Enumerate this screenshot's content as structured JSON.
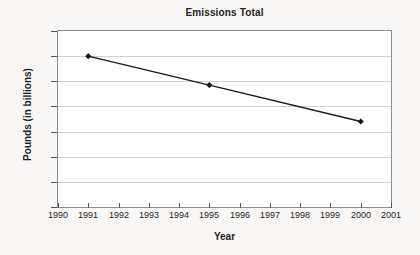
{
  "chart_data": {
    "type": "line",
    "title": "Emissions Total",
    "xlabel": "Year",
    "ylabel": "Pounds (in billions)",
    "x": [
      1991,
      1995,
      2000
    ],
    "values": [
      1.2,
      0.97,
      0.68
    ],
    "series": [
      {
        "name": "Emissions Total",
        "x": [
          1991,
          1995,
          2000
        ],
        "values": [
          1.2,
          0.97,
          0.68
        ]
      }
    ],
    "xlim": [
      1990,
      2001
    ],
    "ylim": [
      0,
      1.4
    ],
    "x_ticks": [
      "1990",
      "1991",
      "1992",
      "1993",
      "1994",
      "1995",
      "1996",
      "1997",
      "1998",
      "1999",
      "2000",
      "2001"
    ],
    "x_tick_values": [
      1990,
      1991,
      1992,
      1993,
      1994,
      1995,
      1996,
      1997,
      1998,
      1999,
      2000,
      2001
    ],
    "y_ticks": [
      "0",
      "0.2",
      "0.4",
      "0.6",
      "0.8",
      "1",
      "1.2",
      "1.4"
    ],
    "y_tick_values": [
      0,
      0.2,
      0.4,
      0.6,
      0.8,
      1,
      1.2,
      1.4
    ],
    "grid": "horizontal",
    "legend": "none",
    "marker": "diamond",
    "line_color": "#1a1a1a",
    "marker_color": "#1a1a1a",
    "grid_color": "#d2d2d2",
    "plot_border_color": "#8d8d8d",
    "plot_background": "#ffffff",
    "page_background": "#f8f7f5",
    "text_color": "#242424"
  }
}
